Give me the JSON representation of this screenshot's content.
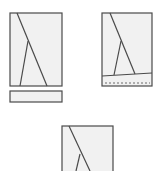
{
  "diagram": {
    "colors": {
      "stroke": "#4a4a4a",
      "fill": "#f1f1f1",
      "background": "#ffffff"
    },
    "figures": [
      {
        "id": "figure-1",
        "panel": {
          "x": 10,
          "y": 13,
          "w": 52,
          "h": 73
        },
        "diagonal": {
          "x1": 17,
          "y1": 13,
          "x2": 47,
          "y2": 86
        },
        "brace": {
          "x1": 28,
          "y1": 41,
          "x2": 20,
          "y2": 86
        },
        "separate_bar": {
          "x": 10,
          "y": 91,
          "w": 52,
          "h": 11
        }
      },
      {
        "id": "figure-2",
        "panel": {
          "x": 102,
          "y": 13,
          "w": 50,
          "h": 73
        },
        "base_line": {
          "x1": 102,
          "y1": 76,
          "x2": 152,
          "y2": 73
        },
        "diagonal": {
          "x1": 110,
          "y1": 13,
          "x2": 135,
          "y2": 74
        },
        "brace": {
          "x1": 121,
          "y1": 41,
          "x2": 114,
          "y2": 75
        },
        "dashed_line": {
          "x1": 105,
          "y1": 83,
          "x2": 150,
          "y2": 83
        }
      },
      {
        "id": "figure-3",
        "panel": {
          "x": 62,
          "y": 126,
          "w": 51,
          "h": 50
        },
        "diagonal": {
          "x1": 69,
          "y1": 126,
          "x2": 90,
          "y2": 171
        },
        "brace": {
          "x1": 80,
          "y1": 154,
          "x2": 76,
          "y2": 171
        }
      }
    ]
  }
}
